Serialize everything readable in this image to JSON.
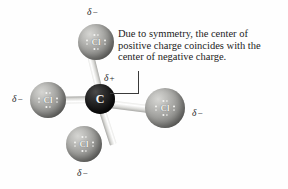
{
  "figure": {
    "background_color": "#fefefe"
  },
  "callout": {
    "text": "Due to symmetry, the center of positive charge coincides with the center of negative charge.",
    "line_color": "#3a3a3a"
  },
  "center_atom": {
    "symbol": "C",
    "charge_label": "δ",
    "charge_sign": "+",
    "color": "#141414"
  },
  "atoms": [
    {
      "id": "cl-top",
      "symbol": "Cl",
      "charge_label": "δ",
      "charge_sign": "−",
      "position": "top",
      "color": "#9d9d9a"
    },
    {
      "id": "cl-left",
      "symbol": "Cl",
      "charge_label": "δ",
      "charge_sign": "−",
      "position": "left",
      "color": "#9d9d9a"
    },
    {
      "id": "cl-right",
      "symbol": "Cl",
      "charge_label": "δ",
      "charge_sign": "−",
      "position": "right",
      "color": "#9d9d9a"
    },
    {
      "id": "cl-bottom",
      "symbol": "Cl",
      "charge_label": "δ",
      "charge_sign": "−",
      "position": "bottom",
      "color": "#9d9d9a"
    }
  ]
}
